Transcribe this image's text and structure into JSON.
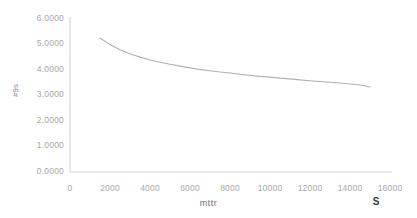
{
  "chart_data": {
    "type": "line",
    "title": "",
    "xlabel": "mttr",
    "ylabel": "#9s",
    "xlim": [
      0,
      16000
    ],
    "ylim": [
      0,
      6.0
    ],
    "grid": false,
    "legend": null,
    "annotations": [
      {
        "text": "S",
        "near_tick": "16000",
        "position": "below-x-axis-right"
      }
    ],
    "x_ticks": [
      "0",
      "2000",
      "4000",
      "6000",
      "8000",
      "10000",
      "12000",
      "14000",
      "16000"
    ],
    "y_ticks": [
      "0.0000",
      "1.0000",
      "2.0000",
      "3.0000",
      "4.0000",
      "5.0000",
      "6.0000"
    ],
    "series": [
      {
        "name": "S",
        "color": "#b0b0b0",
        "x": [
          1500,
          2000,
          2500,
          3000,
          3500,
          4000,
          4500,
          5000,
          5500,
          6000,
          6500,
          7000,
          7500,
          8000,
          8500,
          9000,
          9500,
          10000,
          10500,
          11000,
          11500,
          12000,
          12500,
          13000,
          13500,
          14000,
          14500,
          15000
        ],
        "values": [
          5.22,
          4.96,
          4.76,
          4.6,
          4.47,
          4.36,
          4.27,
          4.19,
          4.12,
          4.05,
          3.99,
          3.94,
          3.89,
          3.85,
          3.8,
          3.76,
          3.72,
          3.69,
          3.65,
          3.62,
          3.58,
          3.55,
          3.52,
          3.49,
          3.46,
          3.42,
          3.38,
          3.3
        ]
      }
    ]
  },
  "axis_style": {
    "axis_line_color": "#d0d0d0",
    "tick_label_color": "#a8a8a8",
    "background": "#ffffff"
  }
}
